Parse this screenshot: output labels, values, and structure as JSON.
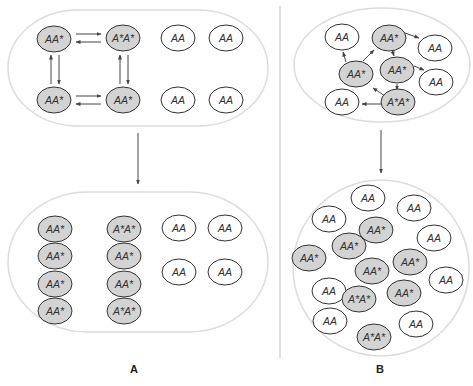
{
  "colors": {
    "background": "#ffffff",
    "container_stroke": "#dcdcdc",
    "cell_stroke": "#333333",
    "mutant_fill": "#d3d3d3",
    "normal_fill": "#ffffff",
    "arrow": "#444444",
    "divider": "#cccccc"
  },
  "panels": {
    "A": {
      "label": "A"
    },
    "B": {
      "label": "B"
    }
  },
  "labels": {
    "AA": "AA",
    "AAstar": "AA*",
    "AstarAstar": "A*A*"
  },
  "panelA": {
    "top_container": {
      "cx": 138,
      "cy": 68,
      "rx": 130,
      "ry": 58
    },
    "top_cells": [
      {
        "label": "AA*",
        "type": "mutant",
        "cx": 54,
        "cy": 39
      },
      {
        "label": "A*A*",
        "type": "mutant",
        "cx": 123,
        "cy": 38
      },
      {
        "label": "AA",
        "type": "normal",
        "cx": 178,
        "cy": 38
      },
      {
        "label": "AA",
        "type": "normal",
        "cx": 226,
        "cy": 38
      },
      {
        "label": "AA*",
        "type": "mutant",
        "cx": 54,
        "cy": 100
      },
      {
        "label": "AA*",
        "type": "mutant",
        "cx": 123,
        "cy": 100
      },
      {
        "label": "AA",
        "type": "normal",
        "cx": 178,
        "cy": 100
      },
      {
        "label": "AA",
        "type": "normal",
        "cx": 226,
        "cy": 100
      }
    ],
    "bottom_container": {
      "cx": 138,
      "cy": 262,
      "rx": 130,
      "ry": 70
    },
    "bottom_cells": [
      {
        "label": "AA*",
        "type": "mutant",
        "cx": 55,
        "cy": 229
      },
      {
        "label": "AA*",
        "type": "mutant",
        "cx": 55,
        "cy": 256
      },
      {
        "label": "AA*",
        "type": "mutant",
        "cx": 55,
        "cy": 284
      },
      {
        "label": "AA*",
        "type": "mutant",
        "cx": 55,
        "cy": 311
      },
      {
        "label": "A*A*",
        "type": "mutant",
        "cx": 124,
        "cy": 229
      },
      {
        "label": "AA*",
        "type": "mutant",
        "cx": 124,
        "cy": 256
      },
      {
        "label": "AA*",
        "type": "mutant",
        "cx": 124,
        "cy": 284
      },
      {
        "label": "A*A*",
        "type": "mutant",
        "cx": 124,
        "cy": 311
      },
      {
        "label": "AA",
        "type": "normal",
        "cx": 179,
        "cy": 228
      },
      {
        "label": "AA",
        "type": "normal",
        "cx": 225,
        "cy": 228
      },
      {
        "label": "AA",
        "type": "normal",
        "cx": 179,
        "cy": 272
      },
      {
        "label": "AA",
        "type": "normal",
        "cx": 225,
        "cy": 272
      }
    ]
  },
  "panelB": {
    "top_container": {
      "cx": 382,
      "cy": 65,
      "rx": 88,
      "ry": 57
    },
    "top_cells": [
      {
        "label": "AA",
        "type": "normal",
        "cx": 342,
        "cy": 37
      },
      {
        "label": "AA*",
        "type": "mutant",
        "cx": 389,
        "cy": 38
      },
      {
        "label": "AA",
        "type": "normal",
        "cx": 435,
        "cy": 48
      },
      {
        "label": "AA*",
        "type": "mutant",
        "cx": 356,
        "cy": 74
      },
      {
        "label": "AA*",
        "type": "mutant",
        "cx": 397,
        "cy": 70
      },
      {
        "label": "AA",
        "type": "normal",
        "cx": 436,
        "cy": 82
      },
      {
        "label": "AA",
        "type": "normal",
        "cx": 342,
        "cy": 102
      },
      {
        "label": "A*A*",
        "type": "mutant",
        "cx": 398,
        "cy": 102
      }
    ],
    "bottom_container": {
      "cx": 381,
      "cy": 268,
      "r": 88
    },
    "bottom_cells": [
      {
        "label": "AA",
        "type": "normal",
        "cx": 368,
        "cy": 198
      },
      {
        "label": "AA",
        "type": "normal",
        "cx": 414,
        "cy": 208
      },
      {
        "label": "AA",
        "type": "normal",
        "cx": 329,
        "cy": 219
      },
      {
        "label": "AA*",
        "type": "mutant",
        "cx": 376,
        "cy": 230
      },
      {
        "label": "AA",
        "type": "normal",
        "cx": 434,
        "cy": 238
      },
      {
        "label": "AA*",
        "type": "mutant",
        "cx": 349,
        "cy": 246
      },
      {
        "label": "AA*",
        "type": "mutant",
        "cx": 309,
        "cy": 258
      },
      {
        "label": "AA*",
        "type": "mutant",
        "cx": 410,
        "cy": 262
      },
      {
        "label": "AA*",
        "type": "mutant",
        "cx": 372,
        "cy": 271
      },
      {
        "label": "AA",
        "type": "normal",
        "cx": 446,
        "cy": 280
      },
      {
        "label": "AA",
        "type": "normal",
        "cx": 329,
        "cy": 291
      },
      {
        "label": "A*A*",
        "type": "mutant",
        "cx": 359,
        "cy": 299
      },
      {
        "label": "AA*",
        "type": "mutant",
        "cx": 404,
        "cy": 293
      },
      {
        "label": "AA",
        "type": "normal",
        "cx": 330,
        "cy": 321
      },
      {
        "label": "AA",
        "type": "normal",
        "cx": 416,
        "cy": 324
      },
      {
        "label": "A*A*",
        "type": "mutant",
        "cx": 374,
        "cy": 337
      }
    ]
  }
}
